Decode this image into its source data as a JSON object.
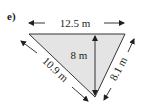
{
  "problem": {
    "part_label": "e)",
    "shape": "triangle",
    "fill_color": "#e4e4e4",
    "stroke_color": "#231f20",
    "dimensions": {
      "top_side": "12.5 m",
      "left_side": "10.9 m",
      "right_side": "8.1 m",
      "height": "8 m"
    }
  }
}
